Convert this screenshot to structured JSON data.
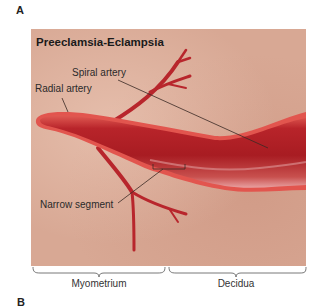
{
  "figure": {
    "panel_a_letter": "A",
    "panel_b_letter": "B",
    "title": "Preeclamsia-Eclampsia",
    "labels": {
      "spiral_artery": "Spiral artery",
      "radial_artery": "Radial artery",
      "narrow_segment": "Narrow segment"
    },
    "regions": {
      "left": "Myometrium",
      "right": "Decidua"
    },
    "colors": {
      "tissue_background": "#d8a894",
      "vessel_dark": "#a81c22",
      "vessel_mid": "#c9302e",
      "vessel_rim": "#e2554e",
      "leader_line": "#3a2a24"
    }
  }
}
